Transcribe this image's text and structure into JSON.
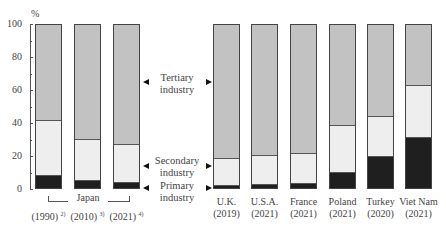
{
  "chart_data": {
    "type": "bar",
    "stacked": true,
    "title": "",
    "xlabel": "",
    "ylabel": "%",
    "ylim": [
      0,
      100
    ],
    "yticks": [
      "0",
      "20",
      "40",
      "60",
      "80",
      "100"
    ],
    "categories": [
      "Japan (1990)",
      "Japan (2010)",
      "Japan (2021)",
      "U.K. (2019)",
      "U.S.A. (2021)",
      "France (2021)",
      "Poland (2021)",
      "Turkey (2020)",
      "Viet Nam (2021)"
    ],
    "series": [
      {
        "name": "Primary industry",
        "color": "#1f1f1f",
        "values": [
          7.5,
          4.4,
          3.2,
          1.0,
          1.7,
          2.5,
          9.3,
          18.6,
          30.1
        ]
      },
      {
        "name": "Secondary industry",
        "color": "#eeeeee",
        "values": [
          33.5,
          25.1,
          23.5,
          17.4,
          18.3,
          18.5,
          28.7,
          25.0,
          32.5
        ]
      },
      {
        "name": "Tertiary industry",
        "color": "#c2c2c2",
        "values": [
          59.0,
          70.5,
          73.3,
          81.6,
          80.0,
          79.0,
          62.0,
          56.4,
          37.4
        ]
      }
    ],
    "legend_position": "center, between Japan group and other countries"
  },
  "axis": {
    "unit": "%",
    "ticks": [
      "0",
      "20",
      "40",
      "60",
      "80",
      "100"
    ]
  },
  "group_label": "Japan",
  "bars": [
    {
      "line1": "(1990)",
      "note": "2)",
      "primary": 7.5,
      "secondary": 33.5
    },
    {
      "line1": "(2010)",
      "note": "3)",
      "primary": 4.4,
      "secondary": 25.1
    },
    {
      "line1": "(2021)",
      "note": "4)",
      "primary": 3.2,
      "secondary": 23.5
    },
    {
      "line1": "U.K.",
      "line2": "(2019)",
      "primary": 1.0,
      "secondary": 17.4
    },
    {
      "line1": "U.S.A.",
      "line2": "(2021)",
      "primary": 1.7,
      "secondary": 18.3
    },
    {
      "line1": "France",
      "line2": "(2021)",
      "primary": 2.5,
      "secondary": 18.5
    },
    {
      "line1": "Poland",
      "line2": "(2021)",
      "primary": 9.3,
      "secondary": 28.7
    },
    {
      "line1": "Turkey",
      "line2": "(2020)",
      "primary": 18.6,
      "secondary": 25.0
    },
    {
      "line1": "Viet Nam",
      "line2": "(2021)",
      "primary": 30.1,
      "secondary": 32.5
    }
  ],
  "legend": {
    "tertiary": {
      "line1": "Tertiary",
      "line2": "industry"
    },
    "secondary": {
      "line1": "Secondary",
      "line2": "industry"
    },
    "primary": {
      "line1": "Primary",
      "line2": "industry"
    }
  }
}
